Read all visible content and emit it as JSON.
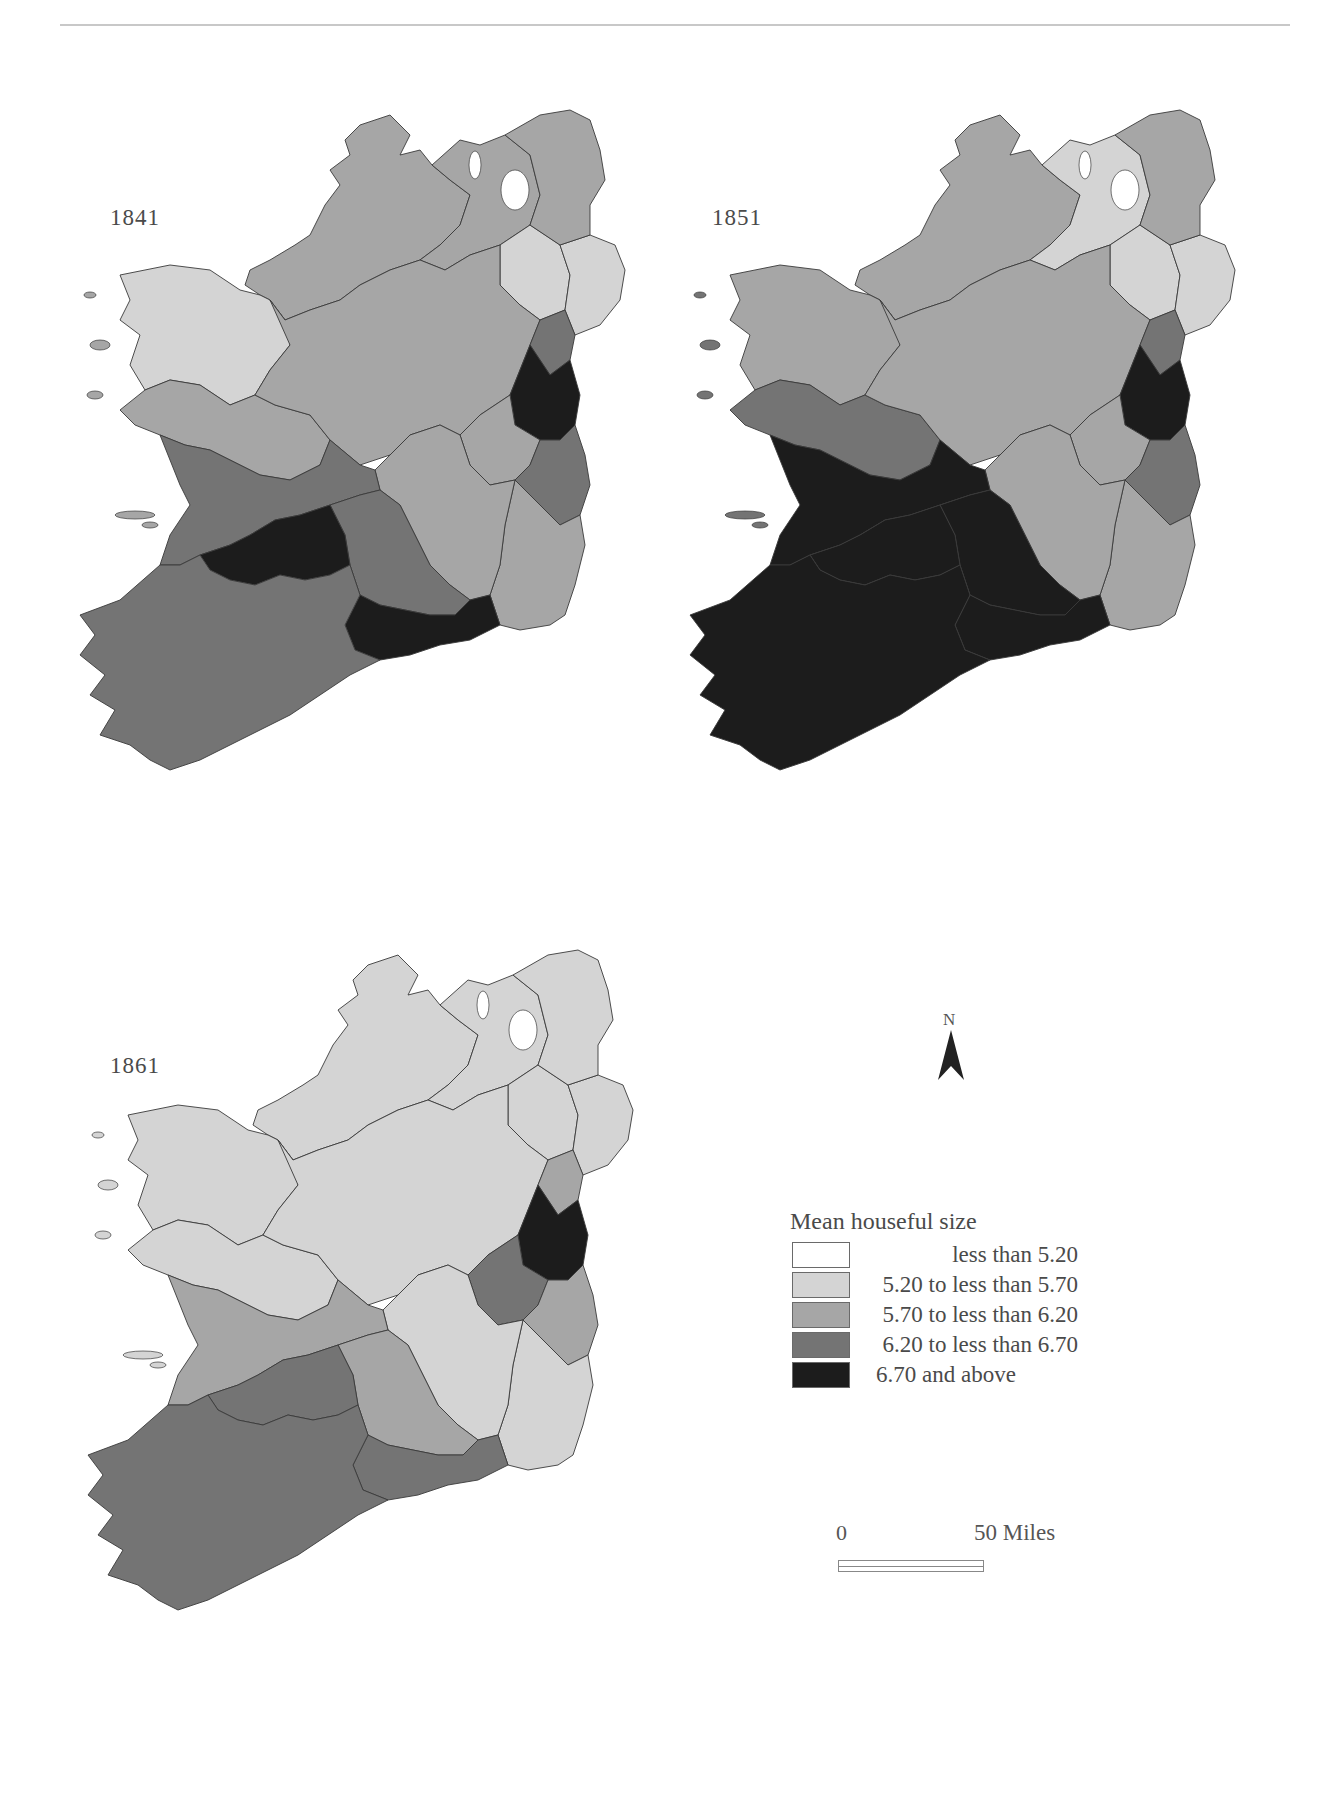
{
  "figure": {
    "panels": [
      {
        "year": "1841"
      },
      {
        "year": "1851"
      },
      {
        "year": "1861"
      }
    ]
  },
  "north_arrow": {
    "label": "N"
  },
  "legend": {
    "title": "Mean houseful size",
    "classes": [
      {
        "label": "less than 5.20",
        "color": "#ffffff"
      },
      {
        "label": "5.20 to less than 5.70",
        "color": "#d4d4d4"
      },
      {
        "label": "5.70 to less than 6.20",
        "color": "#a6a6a6"
      },
      {
        "label": "6.20 to less than 6.70",
        "color": "#747474"
      },
      {
        "label": "6.70 and above",
        "color": "#1c1c1c"
      }
    ]
  },
  "scale_bar": {
    "start_label": "0",
    "end_label": "50 Miles"
  },
  "chart_data": {
    "type": "choropleth",
    "title": "Mean houseful size",
    "years": [
      "1841",
      "1851",
      "1861"
    ],
    "classes": [
      "less than 5.20",
      "5.20 to less than 5.70",
      "5.70 to less than 6.20",
      "6.20 to less than 6.70",
      "6.70 and above"
    ],
    "regions_by_year": {
      "1841": {
        "north_west": "5.70 to less than 6.20",
        "north_central": "5.70 to less than 6.20",
        "north_east_inland": "5.20 to less than 5.70",
        "north_east_coast": "5.20 to less than 5.70",
        "north_east_tip": "5.70 to less than 6.20",
        "west_mayo": "5.20 to less than 5.70",
        "west_galway": "5.70 to less than 6.20",
        "midlands": "5.70 to less than 6.20",
        "louth": "6.20 to less than 6.70",
        "dublin": "6.70 and above",
        "wicklow": "6.20 to less than 6.70",
        "wexford": "5.70 to less than 6.20",
        "kilkenny_carlow": "5.70 to less than 6.20",
        "clare": "6.20 to less than 6.70",
        "tipperary": "6.20 to less than 6.70",
        "limerick": "6.70 and above",
        "waterford": "6.70 and above",
        "kerry_cork": "6.20 to less than 6.70"
      },
      "1851": {
        "north_west": "5.70 to less than 6.20",
        "north_central": "5.20 to less than 5.70",
        "north_east_inland": "5.20 to less than 5.70",
        "north_east_coast": "5.20 to less than 5.70",
        "north_east_tip": "5.70 to less than 6.20",
        "west_mayo": "5.70 to less than 6.20",
        "west_galway": "6.20 to less than 6.70",
        "midlands": "5.70 to less than 6.20",
        "louth": "6.20 to less than 6.70",
        "dublin": "6.70 and above",
        "wicklow": "6.20 to less than 6.70",
        "wexford": "5.70 to less than 6.20",
        "kilkenny_carlow": "5.70 to less than 6.20",
        "clare": "6.70 and above",
        "tipperary": "6.70 and above",
        "limerick": "6.70 and above",
        "waterford": "6.70 and above",
        "kerry_cork": "6.70 and above"
      },
      "1861": {
        "north_west": "5.20 to less than 5.70",
        "north_central": "5.20 to less than 5.70",
        "north_east_inland": "5.20 to less than 5.70",
        "north_east_coast": "5.20 to less than 5.70",
        "north_east_tip": "5.20 to less than 5.70",
        "west_mayo": "5.20 to less than 5.70",
        "west_galway": "5.20 to less than 5.70",
        "midlands": "5.20 to less than 5.70",
        "louth": "5.70 to less than 6.20",
        "dublin": "6.70 and above",
        "kildare": "6.20 to less than 6.70",
        "wicklow": "5.70 to less than 6.20",
        "wexford": "5.20 to less than 5.70",
        "kilkenny_carlow": "5.20 to less than 5.70",
        "clare": "5.70 to less than 6.20",
        "tipperary": "5.70 to less than 6.20",
        "limerick": "6.20 to less than 6.70",
        "waterford": "6.20 to less than 6.70",
        "kerry_cork": "6.20 to less than 6.70"
      }
    }
  }
}
